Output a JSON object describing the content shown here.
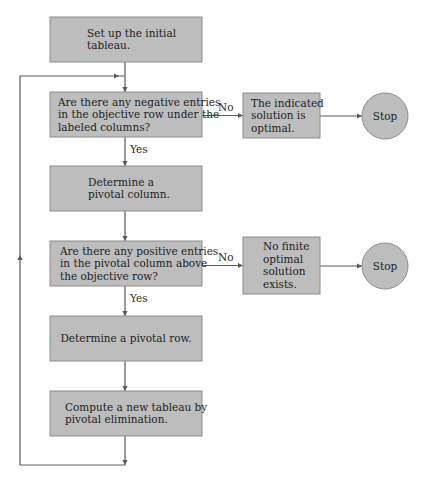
{
  "flowchart": {
    "nodes": [
      {
        "id": "setup",
        "kind": "process",
        "lines": [
          "Set up the initial",
          "tableau."
        ]
      },
      {
        "id": "neg-check",
        "kind": "decision",
        "lines": [
          "Are there any negative entries",
          "in the objective row under the",
          "labeled columns?"
        ]
      },
      {
        "id": "pivot-col",
        "kind": "process",
        "lines": [
          "Determine a",
          "pivotal column."
        ]
      },
      {
        "id": "pos-check",
        "kind": "decision",
        "lines": [
          "Are there any positive entries",
          "in the pivotal column above",
          "the objective row?"
        ]
      },
      {
        "id": "pivot-row",
        "kind": "process",
        "lines": [
          "Determine a pivotal row."
        ]
      },
      {
        "id": "compute",
        "kind": "process",
        "lines": [
          "Compute a new tableau by",
          "pivotal elimination."
        ]
      },
      {
        "id": "optimal",
        "kind": "outcome",
        "lines": [
          "The indicated",
          "solution is",
          "optimal."
        ]
      },
      {
        "id": "no-finite",
        "kind": "outcome",
        "lines": [
          "No finite",
          "optimal",
          "solution",
          "exists."
        ]
      },
      {
        "id": "stop-1",
        "kind": "terminal",
        "lines": [
          "Stop"
        ]
      },
      {
        "id": "stop-2",
        "kind": "terminal",
        "lines": [
          "Stop"
        ]
      }
    ],
    "edges": [
      {
        "from": "setup",
        "to": "neg-check",
        "label": ""
      },
      {
        "from": "neg-check",
        "to": "optimal",
        "label": "No"
      },
      {
        "from": "optimal",
        "to": "stop-1",
        "label": ""
      },
      {
        "from": "neg-check",
        "to": "pivot-col",
        "label": "Yes"
      },
      {
        "from": "pivot-col",
        "to": "pos-check",
        "label": ""
      },
      {
        "from": "pos-check",
        "to": "no-finite",
        "label": "No"
      },
      {
        "from": "no-finite",
        "to": "stop-2",
        "label": ""
      },
      {
        "from": "pos-check",
        "to": "pivot-row",
        "label": "Yes"
      },
      {
        "from": "pivot-row",
        "to": "compute",
        "label": ""
      },
      {
        "from": "compute",
        "to": "neg-check",
        "label": "",
        "loop": true
      }
    ],
    "colors": {
      "node_fill": "#bdbdbd",
      "node_border": "#8c8c8c",
      "connector": "#5a5a5a",
      "text": "#1e1e1e"
    }
  }
}
